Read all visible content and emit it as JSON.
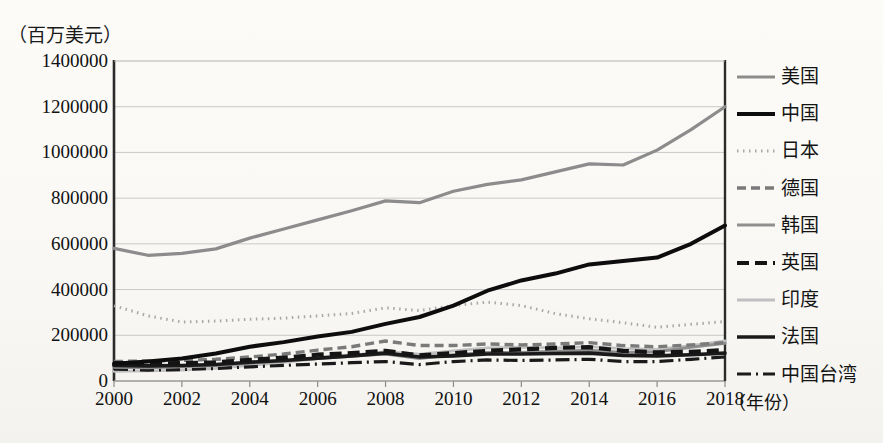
{
  "axis_unit_label": "（百万美元）",
  "xaxis_title": "（年份）",
  "legend": [
    {
      "label": "美国",
      "style": "solid-gray",
      "color": "#8c8c8c",
      "width": 3.2,
      "dash": ""
    },
    {
      "label": "中国",
      "style": "solid-black-thick",
      "color": "#0d0d0d",
      "width": 4.0,
      "dash": ""
    },
    {
      "label": "日本",
      "style": "dotted-light",
      "color": "#a8a8a8",
      "width": 3.0,
      "dash": "1.5,4.5"
    },
    {
      "label": "德国",
      "style": "dashed-gray",
      "color": "#7a7a7a",
      "width": 3.4,
      "dash": "9,5"
    },
    {
      "label": "韩国",
      "style": "solid-gray-mid",
      "color": "#8f8f8f",
      "width": 3.0,
      "dash": ""
    },
    {
      "label": "英国",
      "style": "dashed-black-thick",
      "color": "#141414",
      "width": 4.2,
      "dash": "12,6"
    },
    {
      "label": "印度",
      "style": "solid-light-gray",
      "color": "#c0c0c0",
      "width": 2.8,
      "dash": ""
    },
    {
      "label": "法国",
      "style": "solid-black",
      "color": "#1a1a1a",
      "width": 3.6,
      "dash": ""
    },
    {
      "label": "中国台湾",
      "style": "dashdot-black",
      "color": "#1a1a1a",
      "width": 3.2,
      "dash": "14,5,2,5"
    }
  ],
  "chart_data": {
    "type": "line",
    "title": "",
    "subtitle": "",
    "xlabel": "（年份）",
    "ylabel": "（百万美元）",
    "xlim": [
      2000,
      2018
    ],
    "ylim": [
      0,
      1400000
    ],
    "ytick_values": [
      0,
      200000,
      400000,
      600000,
      800000,
      1000000,
      1200000,
      1400000
    ],
    "ytick_labels": [
      "0",
      "200000",
      "400000",
      "600000",
      "800000",
      "1000000",
      "1200000",
      "1400000"
    ],
    "xtick_values": [
      2000,
      2002,
      2004,
      2006,
      2008,
      2010,
      2012,
      2014,
      2016,
      2018
    ],
    "xtick_labels": [
      "2000",
      "2002",
      "2004",
      "2006",
      "2008",
      "2010",
      "2012",
      "2014",
      "2016",
      "2018"
    ],
    "grid": "horizontal",
    "legend_position": "right",
    "x": [
      2000,
      2001,
      2002,
      2003,
      2004,
      2005,
      2006,
      2007,
      2008,
      2009,
      2010,
      2011,
      2012,
      2013,
      2014,
      2015,
      2016,
      2017,
      2018
    ],
    "series": [
      {
        "name": "美国",
        "values": [
          580000,
          550000,
          558000,
          578000,
          625000,
          665000,
          705000,
          745000,
          788000,
          780000,
          830000,
          860000,
          880000,
          915000,
          950000,
          945000,
          1010000,
          1100000,
          1200000
        ]
      },
      {
        "name": "中国",
        "values": [
          75000,
          85000,
          98000,
          120000,
          150000,
          170000,
          195000,
          215000,
          250000,
          280000,
          330000,
          395000,
          440000,
          470000,
          510000,
          525000,
          540000,
          600000,
          680000
        ]
      },
      {
        "name": "日本",
        "values": [
          330000,
          285000,
          258000,
          262000,
          270000,
          275000,
          285000,
          295000,
          320000,
          308000,
          330000,
          345000,
          330000,
          295000,
          272000,
          255000,
          235000,
          248000,
          260000
        ]
      },
      {
        "name": "德国",
        "values": [
          85000,
          88000,
          90000,
          95000,
          105000,
          118000,
          135000,
          150000,
          175000,
          155000,
          155000,
          162000,
          158000,
          162000,
          168000,
          155000,
          150000,
          158000,
          168000
        ]
      },
      {
        "name": "韩国",
        "values": [
          60000,
          58000,
          62000,
          68000,
          78000,
          88000,
          98000,
          108000,
          118000,
          98000,
          115000,
          125000,
          125000,
          130000,
          135000,
          125000,
          128000,
          148000,
          165000
        ]
      },
      {
        "name": "英国",
        "values": [
          78000,
          76000,
          78000,
          82000,
          92000,
          102000,
          115000,
          122000,
          132000,
          112000,
          122000,
          132000,
          138000,
          145000,
          148000,
          132000,
          125000,
          128000,
          135000
        ]
      },
      {
        "name": "印度",
        "values": [
          42000,
          44000,
          48000,
          55000,
          68000,
          82000,
          98000,
          112000,
          128000,
          118000,
          132000,
          145000,
          148000,
          145000,
          150000,
          142000,
          138000,
          155000,
          175000
        ]
      },
      {
        "name": "法国",
        "values": [
          68000,
          66000,
          68000,
          72000,
          82000,
          90000,
          100000,
          110000,
          122000,
          105000,
          110000,
          118000,
          118000,
          120000,
          122000,
          112000,
          110000,
          115000,
          122000
        ]
      },
      {
        "name": "中国台湾",
        "values": [
          52000,
          48000,
          50000,
          55000,
          62000,
          68000,
          74000,
          80000,
          85000,
          72000,
          85000,
          92000,
          90000,
          92000,
          95000,
          85000,
          85000,
          95000,
          105000
        ]
      }
    ]
  }
}
